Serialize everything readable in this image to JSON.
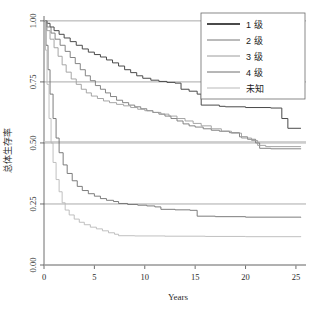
{
  "chart_data": {
    "type": "line",
    "title": "",
    "xlabel": "Years",
    "ylabel": "总体生存率",
    "xlim": [
      0,
      26
    ],
    "ylim": [
      0,
      1.02
    ],
    "xticks": [
      "0",
      "5",
      "10",
      "15",
      "20",
      "25"
    ],
    "xtick_values": [
      0,
      5,
      10,
      15,
      20,
      25
    ],
    "yticks": [
      "0.00",
      "0.25",
      "0.50",
      "0.75",
      "1.00"
    ],
    "ytick_values": [
      0.0,
      0.25,
      0.5,
      0.75,
      1.0
    ],
    "grid": true,
    "grid_levels": [
      0.0,
      0.25,
      0.5,
      0.75,
      1.0
    ],
    "legend_position": "top-right",
    "legend_entries": [
      "1 级",
      "2 级",
      "3 级",
      "4 级",
      "未知"
    ],
    "series": [
      {
        "name": "1 级",
        "color": "#4a4a4a",
        "points": [
          [
            0,
            1.0
          ],
          [
            0.3,
            0.99
          ],
          [
            0.6,
            0.975
          ],
          [
            1.0,
            0.96
          ],
          [
            1.5,
            0.945
          ],
          [
            2.0,
            0.93
          ],
          [
            2.6,
            0.915
          ],
          [
            3.2,
            0.9
          ],
          [
            3.8,
            0.885
          ],
          [
            4.4,
            0.872
          ],
          [
            5.0,
            0.862
          ],
          [
            5.6,
            0.852
          ],
          [
            6.2,
            0.84
          ],
          [
            6.8,
            0.828
          ],
          [
            7.4,
            0.815
          ],
          [
            8.0,
            0.8
          ],
          [
            8.6,
            0.788
          ],
          [
            9.2,
            0.775
          ],
          [
            9.8,
            0.765
          ],
          [
            10.6,
            0.757
          ],
          [
            11.4,
            0.752
          ],
          [
            12.2,
            0.748
          ],
          [
            13.0,
            0.745
          ],
          [
            13.6,
            0.72
          ],
          [
            14.4,
            0.712
          ],
          [
            15.2,
            0.7
          ],
          [
            15.6,
            0.655
          ],
          [
            17.4,
            0.65
          ],
          [
            18.0,
            0.648
          ],
          [
            20.0,
            0.645
          ],
          [
            22.5,
            0.643
          ],
          [
            23.6,
            0.6
          ],
          [
            24.2,
            0.56
          ],
          [
            25.5,
            0.56
          ]
        ]
      },
      {
        "name": "2 级",
        "color": "#777777",
        "points": [
          [
            0,
            1.0
          ],
          [
            0.3,
            0.975
          ],
          [
            0.7,
            0.95
          ],
          [
            1.1,
            0.925
          ],
          [
            1.6,
            0.9
          ],
          [
            2.1,
            0.875
          ],
          [
            2.6,
            0.85
          ],
          [
            3.1,
            0.825
          ],
          [
            3.6,
            0.8
          ],
          [
            4.1,
            0.775
          ],
          [
            4.6,
            0.755
          ],
          [
            5.1,
            0.735
          ],
          [
            5.6,
            0.72
          ],
          [
            6.1,
            0.705
          ],
          [
            6.6,
            0.69
          ],
          [
            7.2,
            0.675
          ],
          [
            7.8,
            0.665
          ],
          [
            8.4,
            0.655
          ],
          [
            9.0,
            0.648
          ],
          [
            9.6,
            0.64
          ],
          [
            10.2,
            0.632
          ],
          [
            10.8,
            0.625
          ],
          [
            11.4,
            0.618
          ],
          [
            12.0,
            0.61
          ],
          [
            12.6,
            0.6
          ],
          [
            13.2,
            0.59
          ],
          [
            13.8,
            0.578
          ],
          [
            14.4,
            0.57
          ],
          [
            15.0,
            0.565
          ],
          [
            15.8,
            0.558
          ],
          [
            16.6,
            0.552
          ],
          [
            17.4,
            0.548
          ],
          [
            18.4,
            0.542
          ],
          [
            19.4,
            0.525
          ],
          [
            20.2,
            0.515
          ],
          [
            21.0,
            0.5
          ],
          [
            21.4,
            0.478
          ],
          [
            22.5,
            0.476
          ],
          [
            25.5,
            0.475
          ]
        ]
      },
      {
        "name": "3 级",
        "color": "#9c9c9c",
        "points": [
          [
            0,
            1.0
          ],
          [
            0.3,
            0.96
          ],
          [
            0.6,
            0.925
          ],
          [
            1.0,
            0.89
          ],
          [
            1.4,
            0.855
          ],
          [
            1.8,
            0.82
          ],
          [
            2.2,
            0.79
          ],
          [
            2.7,
            0.762
          ],
          [
            3.2,
            0.74
          ],
          [
            3.7,
            0.72
          ],
          [
            4.2,
            0.705
          ],
          [
            4.7,
            0.692
          ],
          [
            5.3,
            0.682
          ],
          [
            5.9,
            0.672
          ],
          [
            6.5,
            0.665
          ],
          [
            7.2,
            0.658
          ],
          [
            7.9,
            0.652
          ],
          [
            8.6,
            0.645
          ],
          [
            9.3,
            0.638
          ],
          [
            10.0,
            0.632
          ],
          [
            10.8,
            0.625
          ],
          [
            11.6,
            0.618
          ],
          [
            12.4,
            0.61
          ],
          [
            13.2,
            0.6
          ],
          [
            14.0,
            0.59
          ],
          [
            14.8,
            0.58
          ],
          [
            15.6,
            0.57
          ],
          [
            16.6,
            0.558
          ],
          [
            17.6,
            0.548
          ],
          [
            18.6,
            0.54
          ],
          [
            19.6,
            0.52
          ],
          [
            20.6,
            0.51
          ],
          [
            21.2,
            0.49
          ],
          [
            22.0,
            0.485
          ],
          [
            25.5,
            0.485
          ]
        ]
      },
      {
        "name": "4 级",
        "color": "#6e6e6e",
        "points": [
          [
            0,
            1.0
          ],
          [
            0.2,
            0.9
          ],
          [
            0.4,
            0.8
          ],
          [
            0.6,
            0.7
          ],
          [
            0.9,
            0.6
          ],
          [
            1.2,
            0.52
          ],
          [
            1.5,
            0.46
          ],
          [
            1.9,
            0.41
          ],
          [
            2.3,
            0.375
          ],
          [
            2.8,
            0.345
          ],
          [
            3.3,
            0.322
          ],
          [
            3.8,
            0.305
          ],
          [
            4.4,
            0.292
          ],
          [
            5.0,
            0.282
          ],
          [
            5.6,
            0.272
          ],
          [
            6.2,
            0.265
          ],
          [
            6.9,
            0.26
          ],
          [
            7.4,
            0.252
          ],
          [
            8.3,
            0.248
          ],
          [
            9.3,
            0.245
          ],
          [
            10.2,
            0.242
          ],
          [
            11.0,
            0.238
          ],
          [
            11.6,
            0.228
          ],
          [
            13.0,
            0.226
          ],
          [
            14.5,
            0.224
          ],
          [
            15.2,
            0.2
          ],
          [
            17.0,
            0.198
          ],
          [
            20.0,
            0.196
          ],
          [
            25.5,
            0.195
          ]
        ]
      },
      {
        "name": "未知",
        "color": "#b9b9b9",
        "points": [
          [
            0,
            1.0
          ],
          [
            0.15,
            0.88
          ],
          [
            0.3,
            0.74
          ],
          [
            0.5,
            0.6
          ],
          [
            0.7,
            0.5
          ],
          [
            0.9,
            0.42
          ],
          [
            1.2,
            0.35
          ],
          [
            1.5,
            0.3
          ],
          [
            1.8,
            0.255
          ],
          [
            2.1,
            0.225
          ],
          [
            2.5,
            0.205
          ],
          [
            3.0,
            0.188
          ],
          [
            3.5,
            0.175
          ],
          [
            4.0,
            0.165
          ],
          [
            4.6,
            0.155
          ],
          [
            5.2,
            0.148
          ],
          [
            5.8,
            0.14
          ],
          [
            6.4,
            0.132
          ],
          [
            7.0,
            0.126
          ],
          [
            7.4,
            0.12
          ],
          [
            9.0,
            0.119
          ],
          [
            12.0,
            0.118
          ],
          [
            16.0,
            0.117
          ],
          [
            20.0,
            0.116
          ],
          [
            25.5,
            0.115
          ]
        ]
      }
    ],
    "reference_lines": [
      {
        "name": "baseline-0",
        "y": 0.0,
        "color": "#c4c4c4"
      },
      {
        "name": "baseline-050",
        "y": 0.505,
        "color": "#c4c4c4"
      }
    ]
  }
}
